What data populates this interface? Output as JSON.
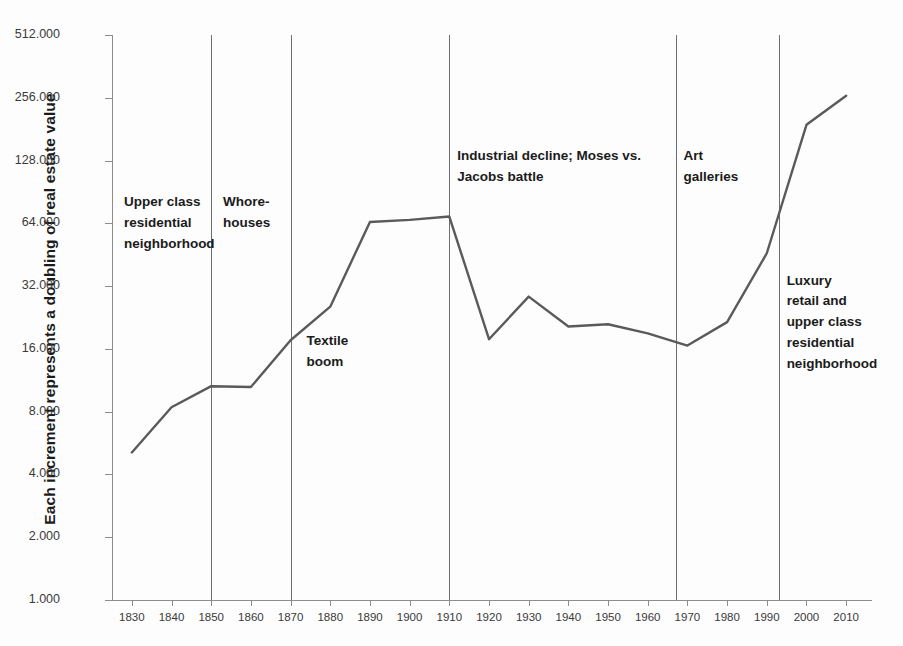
{
  "chart_data": {
    "type": "line",
    "title": "",
    "xlabel": "",
    "ylabel": "Each increment represents a doubling of real estate value",
    "x": [
      1830,
      1840,
      1850,
      1860,
      1870,
      1880,
      1890,
      1900,
      1910,
      1920,
      1930,
      1940,
      1950,
      1960,
      1970,
      1980,
      1990,
      2000,
      2010
    ],
    "values": [
      5.1,
      8.4,
      10.6,
      10.5,
      17.6,
      25.5,
      65.0,
      66.5,
      69.0,
      17.8,
      28.5,
      20.5,
      21.0,
      19.0,
      16.6,
      21.5,
      46.0,
      190.0,
      262.0
    ],
    "series": [
      {
        "name": "Real estate value index",
        "values": [
          5.1,
          8.4,
          10.6,
          10.5,
          17.6,
          25.5,
          65.0,
          66.5,
          69.0,
          17.8,
          28.5,
          20.5,
          21.0,
          19.0,
          16.6,
          21.5,
          46.0,
          190.0,
          262.0
        ]
      }
    ],
    "yscale": "log2",
    "ylim": [
      1,
      512
    ],
    "xlim": [
      1825,
      2015
    ],
    "yticks": [
      "1.000",
      "2.000",
      "4.000",
      "8.000",
      "16.000",
      "32.000",
      "64.000",
      "128.000",
      "256.000",
      "512.000"
    ],
    "ytick_values": [
      1,
      2,
      4,
      8,
      16,
      32,
      64,
      128,
      256,
      512
    ],
    "xticks": [
      "1830",
      "1840",
      "1850",
      "1860",
      "1870",
      "1880",
      "1890",
      "1900",
      "1910",
      "1920",
      "1930",
      "1940",
      "1950",
      "1960",
      "1970",
      "1980",
      "1990",
      "2000",
      "2010"
    ],
    "grid": false,
    "legend": "none",
    "line_color": "#5a5a5a",
    "axis_color": "#8d8d8d",
    "dividers": [
      1850,
      1870,
      1910,
      1967,
      1993
    ],
    "annotations": [
      {
        "id": "upper-class-residential",
        "text": "Upper class\nresidential\nneighborhood",
        "x": 1828,
        "y_value": 90
      },
      {
        "id": "whorehouses",
        "text": "Whore-\nhouses",
        "x": 1853,
        "y_value": 90
      },
      {
        "id": "textile-boom",
        "text": "Textile\nboom",
        "x": 1874,
        "y_value": 19.5
      },
      {
        "id": "industrial-decline",
        "text": "Industrial  decline; Moses vs.\nJacobs battle",
        "x": 1912,
        "y_value": 150
      },
      {
        "id": "art-galleries",
        "text": "Art\ngalleries",
        "x": 1969,
        "y_value": 150
      },
      {
        "id": "luxury-retail",
        "text": "Luxury\nretail and\nupper class\nresidential\nneighborhood",
        "x": 1995,
        "y_value": 38
      }
    ]
  }
}
